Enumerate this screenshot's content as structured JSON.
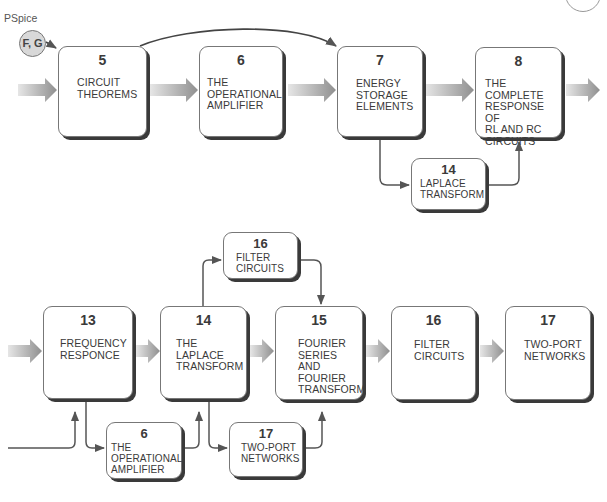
{
  "pspice": {
    "label": "PSpice",
    "badge": "F, G"
  },
  "row1": {
    "boxes": [
      {
        "number": "5",
        "label": "CIRCUIT\nTHEOREMS"
      },
      {
        "number": "6",
        "label": "THE\nOPERATIONAL\nAMPLIFIER"
      },
      {
        "number": "7",
        "label": "ENERGY\nSTORAGE\nELEMENTS"
      },
      {
        "number": "8",
        "label": "THE COMPLETE\nRESPONSE OF\nRL AND RC\nCIRCUITS"
      }
    ],
    "branch": {
      "number": "14",
      "label": "LAPLACE\nTRANSFORM"
    }
  },
  "row2": {
    "boxes": [
      {
        "number": "13",
        "label": "FREQUENCY\nRESPONCE"
      },
      {
        "number": "14",
        "label": "THE\nLAPLACE\nTRANSFORM"
      },
      {
        "number": "15",
        "label": "FOURIER\nSERIES\nAND\nFOURIER\nTRANSFORM"
      },
      {
        "number": "16",
        "label": "FILTER\nCIRCUITS"
      },
      {
        "number": "17",
        "label": "TWO-PORT\nNETWORKS"
      }
    ],
    "branch_top": {
      "number": "16",
      "label": "FILTER\nCIRCUITS"
    },
    "branch_bottom_left": {
      "number": "6",
      "label": "THE\nOPERATIONAL\nAMPLIFIER"
    },
    "branch_bottom_right": {
      "number": "17",
      "label": "TWO-PORT\nNETWORKS"
    }
  },
  "colors": {
    "box_border": "#777777",
    "box_shadow": "#3a3a3a",
    "arrow_gray": "#9a9a9a",
    "line": "#555555"
  }
}
